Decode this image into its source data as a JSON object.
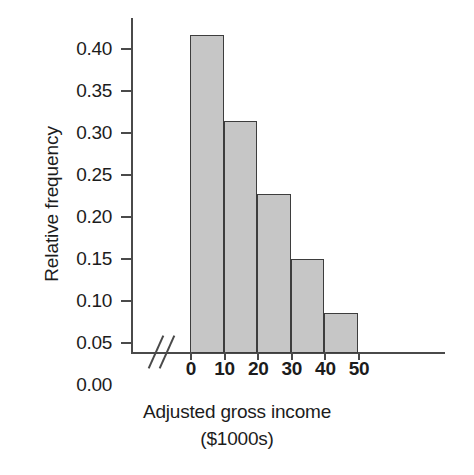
{
  "chart_data": {
    "type": "bar",
    "title": "",
    "subtitle": "",
    "xlabel": "Adjusted gross income",
    "xlabel_line2": "($1000s)",
    "ylabel": "Relative frequency",
    "categories": [
      "0-10",
      "10-20",
      "20-30",
      "30-40",
      "40-50"
    ],
    "bin_edges": [
      0,
      10,
      20,
      30,
      40,
      50
    ],
    "values": [
      0.38,
      0.277,
      0.19,
      0.112,
      0.048
    ],
    "xlim": [
      0,
      50
    ],
    "ylim": [
      0.0,
      0.4
    ],
    "x_tick_labels": [
      "0",
      "10",
      "20",
      "30",
      "40",
      "50"
    ],
    "x_tick_values": [
      0,
      10,
      20,
      30,
      40,
      50
    ],
    "y_tick_labels": [
      "0.40",
      "0.35",
      "0.30",
      "0.25",
      "0.20",
      "0.15",
      "0.10",
      "0.05",
      "0.00"
    ],
    "y_tick_values": [
      0.4,
      0.35,
      0.3,
      0.25,
      0.2,
      0.15,
      0.1,
      0.05,
      0.0
    ],
    "grid": false,
    "legend": "none",
    "axis_break": "//",
    "bar_fill_color": "#c6c6c6",
    "bar_edge_color": "#3d3d3d",
    "axis_color": "#4a4a4a",
    "text_color": "#1c1c1c",
    "background_color": "#ffffff"
  }
}
